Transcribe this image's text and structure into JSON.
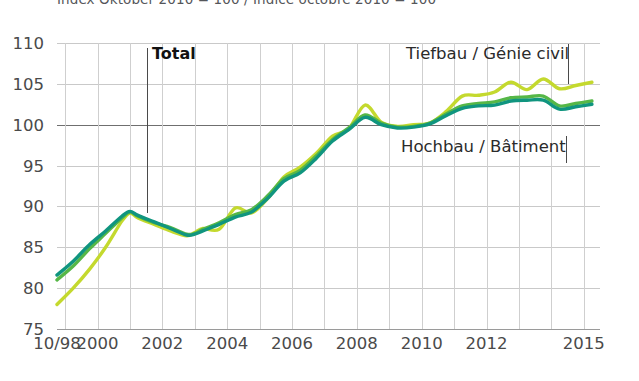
{
  "subtitle": "Index Oktober 2010 = 100 / Indice octobre 2010 = 100",
  "annotations": {
    "total": "Total",
    "tiefbau": "Tiefbau / Génie civil",
    "hochbau": "Hochbau / Bâtiment"
  },
  "colors": {
    "tiefbau": "#c4d92e",
    "total": "#56b747",
    "hochbau": "#10957f"
  },
  "chart_data": {
    "type": "line",
    "title": "",
    "subtitle": "Index Oktober 2010 = 100 / Indice octobre 2010 = 100",
    "xlabel": "",
    "ylabel": "",
    "ylim": [
      75,
      110
    ],
    "y_ticks": [
      75,
      80,
      85,
      90,
      95,
      100,
      105,
      110
    ],
    "xlim": [
      1998.75,
      2015.5
    ],
    "x_tick_labels": [
      "10/98",
      "2000",
      "2002",
      "2004",
      "2006",
      "2008",
      "2010",
      "2012",
      "2015"
    ],
    "x_tick_values": [
      1998.75,
      2000,
      2002,
      2004,
      2006,
      2008,
      2010,
      2012,
      2015
    ],
    "grid": true,
    "reference_line": 100,
    "legend_position": "inline-annotations",
    "x": [
      1998.75,
      1999.25,
      1999.75,
      2000.25,
      2000.75,
      2001.0,
      2001.25,
      2001.75,
      2002.25,
      2002.75,
      2003.0,
      2003.25,
      2003.75,
      2004.25,
      2004.75,
      2005.25,
      2005.75,
      2006.25,
      2006.75,
      2007.25,
      2007.75,
      2008.25,
      2008.75,
      2009.25,
      2009.75,
      2010.25,
      2010.75,
      2011.25,
      2011.75,
      2012.25,
      2012.75,
      2013.25,
      2013.75,
      2014.25,
      2014.75,
      2015.25
    ],
    "series": [
      {
        "name": "Tiefbau / Génie civil",
        "color": "#c4d92e",
        "values": [
          78.0,
          80.0,
          82.3,
          85.0,
          88.2,
          89.2,
          88.6,
          87.8,
          87.0,
          86.4,
          86.8,
          87.3,
          87.2,
          89.8,
          89.2,
          91.0,
          93.6,
          94.8,
          96.5,
          98.6,
          99.5,
          102.4,
          100.3,
          99.8,
          100.0,
          100.2,
          101.6,
          103.5,
          103.6,
          104.0,
          105.2,
          104.3,
          105.6,
          104.4,
          104.8,
          105.2
        ]
      },
      {
        "name": "Total",
        "color": "#56b747",
        "values": [
          81.0,
          82.7,
          84.8,
          86.7,
          88.6,
          89.3,
          88.8,
          88.0,
          87.4,
          86.6,
          86.7,
          87.2,
          88.0,
          89.0,
          89.6,
          91.3,
          93.4,
          94.4,
          96.2,
          98.2,
          99.6,
          101.2,
          100.2,
          99.7,
          99.8,
          100.2,
          101.3,
          102.3,
          102.6,
          102.8,
          103.3,
          103.4,
          103.5,
          102.3,
          102.6,
          102.9
        ]
      },
      {
        "name": "Hochbau / Bâtiment",
        "color": "#10957f",
        "values": [
          81.6,
          83.3,
          85.3,
          87.0,
          88.8,
          89.4,
          88.9,
          88.1,
          87.3,
          86.5,
          86.6,
          87.0,
          87.8,
          88.7,
          89.3,
          91.0,
          93.1,
          94.1,
          95.9,
          98.0,
          99.4,
          100.9,
          100.0,
          99.6,
          99.7,
          100.1,
          101.1,
          102.0,
          102.3,
          102.4,
          102.9,
          103.0,
          103.0,
          101.9,
          102.2,
          102.5
        ]
      }
    ]
  }
}
